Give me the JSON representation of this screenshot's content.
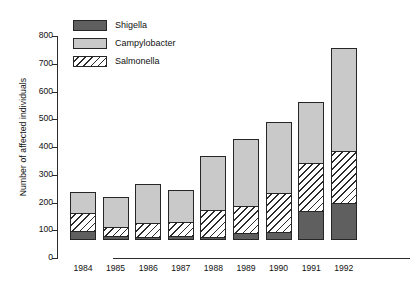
{
  "chart_data": {
    "type": "bar",
    "subtype": "stacked-bar",
    "title": "",
    "xlabel": "",
    "ylabel": "Number of affected individuals",
    "ylim": [
      0,
      800
    ],
    "ytick_step": 100,
    "yticks": [
      0,
      100,
      200,
      300,
      400,
      500,
      600,
      700,
      800
    ],
    "ytick_labels": [
      "0",
      "100",
      "200",
      "300",
      "400",
      "500",
      "600",
      "700",
      "800"
    ],
    "grid": false,
    "legend_position": "top-left",
    "categories": [
      "1984",
      "1985",
      "1986",
      "1987",
      "1988",
      "1989",
      "1990",
      "1991",
      "1992"
    ],
    "stack_order_bottom_to_top": [
      "Shigella",
      "Salmonella",
      "Campylobacter"
    ],
    "series": [
      {
        "name": "Shigella",
        "color": "#5f5f5f",
        "pattern": "solid",
        "values": [
          28,
          12,
          8,
          12,
          8,
          20,
          26,
          102,
          129
        ]
      },
      {
        "name": "Salmonella",
        "color": "#ffffff",
        "pattern": "diagonal-hatch",
        "values": [
          65,
          32,
          50,
          48,
          97,
          99,
          139,
          172,
          188
        ]
      },
      {
        "name": "Campylobacter",
        "color": "#c9c9c9",
        "pattern": "solid",
        "values": [
          75,
          106,
          139,
          115,
          193,
          240,
          257,
          219,
          373
        ]
      }
    ],
    "totals": [
      168,
      150,
      197,
      175,
      298,
      359,
      422,
      493,
      690
    ]
  },
  "legend": {
    "entries": [
      {
        "label": "Shigella"
      },
      {
        "label": "Campylobacter"
      },
      {
        "label": "Salmonella"
      }
    ]
  }
}
